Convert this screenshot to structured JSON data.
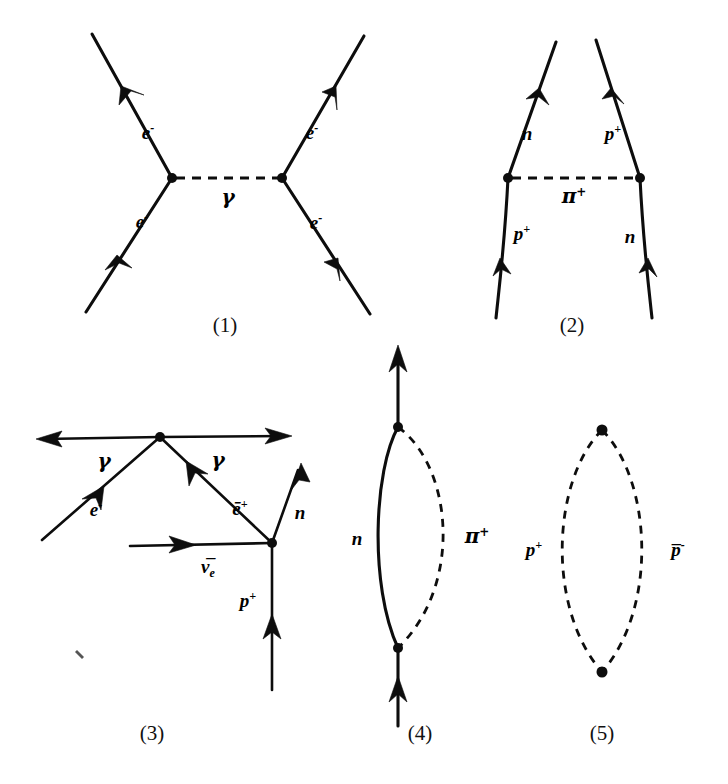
{
  "figure": {
    "background_color": "#ffffff",
    "ink_color": "#0d0d0d",
    "diagram_count": 5
  },
  "diagrams": [
    {
      "id": "diagram-1",
      "caption": "(1)",
      "process": "electron-electron scattering via photon exchange",
      "propagator_label": "γ",
      "propagator_style": "dashed",
      "leg_labels": {
        "top_left": "e",
        "top_left_charge": "-",
        "top_right": "e",
        "top_right_charge": "-",
        "bottom_left": "e",
        "bottom_left_charge": "-",
        "bottom_right": "e",
        "bottom_right_charge": "-"
      }
    },
    {
      "id": "diagram-2",
      "caption": "(2)",
      "process": "proton-neutron scattering via charged pion exchange",
      "propagator_label": "π",
      "propagator_charge": "+",
      "propagator_style": "dashed",
      "leg_labels": {
        "top_left": "n",
        "top_left_charge": "",
        "top_right": "p",
        "top_right_charge": "+",
        "bottom_left": "p",
        "bottom_left_charge": "+",
        "bottom_right": "n",
        "bottom_right_charge": ""
      }
    },
    {
      "id": "diagram-3",
      "caption": "(3)",
      "process": "two-photon emission with positron, antineutrino, proton and neutron lines",
      "leg_labels": {
        "photon_left": "γ",
        "photon_right": "γ",
        "electron": "e",
        "electron_charge": "-",
        "positron": "ē",
        "positron_charge": "+",
        "neutron": "n",
        "antineutrino": "ν̅",
        "antineutrino_sub": "e",
        "proton": "p",
        "proton_charge": "+"
      }
    },
    {
      "id": "diagram-4",
      "caption": "(4)",
      "process": "neutron line emitting and reabsorbing a charged pion (self-energy loop)",
      "leg_labels": {
        "left_arc": "n",
        "right_arc": "π",
        "right_arc_charge": "+"
      }
    },
    {
      "id": "diagram-5",
      "caption": "(5)",
      "process": "closed loop of two dashed lines labelled proton and antiproton",
      "leg_labels": {
        "left_arc": "p",
        "left_arc_charge": "+",
        "right_arc": "p̅",
        "right_arc_charge": "-"
      }
    }
  ],
  "captions": {
    "one": "(1)",
    "two": "(2)",
    "three": "(3)",
    "four": "(4)",
    "five": "(5)"
  }
}
